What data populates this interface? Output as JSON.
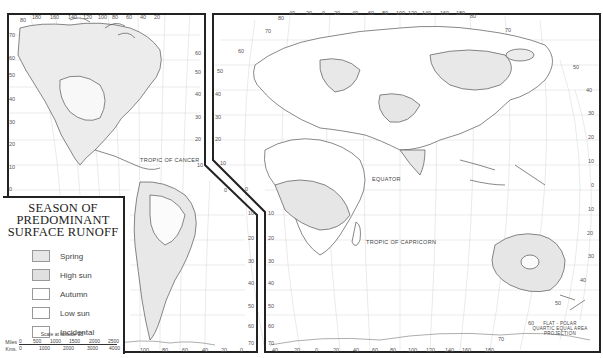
{
  "legend": {
    "title_lines": [
      "SEASON OF",
      "PREDOMINANT",
      "SURFACE RUNOFF"
    ],
    "items": [
      {
        "label": "Spring",
        "color": "#e6e6e6"
      },
      {
        "label": "High sun",
        "color": "#e0e0e0"
      },
      {
        "label": "Autumn",
        "color": "#ffffff"
      },
      {
        "label": "Low sun",
        "color": "#ffffff"
      },
      {
        "label": "Incidental",
        "color": "#ffffff"
      }
    ]
  },
  "scale": {
    "title": "Scale at latitude 35°",
    "miles_label": "Miles",
    "miles_ticks": [
      "0",
      "500",
      "1000",
      "1500",
      "2000",
      "2500"
    ],
    "kms_label": "Kms.",
    "kms_ticks": [
      "0",
      "1000",
      "2000",
      "3000",
      "4000"
    ]
  },
  "map_labels": {
    "tropic_of_cancer": "TROPIC OF CANCER",
    "equator": "EQUATOR",
    "tropic_of_capricorn": "TROPIC OF CAPRICORN",
    "projection_lines": [
      "FLAT - POLAR",
      "QUARTIC EQUAL AREA",
      "PROJECTION"
    ]
  },
  "americas_panel": {
    "top_longitudes": [
      "80",
      "180",
      "160",
      "140",
      "120",
      "100",
      "80",
      "60",
      "40",
      "20"
    ],
    "left_latitudes": [
      "70",
      "60",
      "50",
      "40",
      "30",
      "20",
      "10",
      "0"
    ],
    "right_latitudes": [
      "60",
      "50",
      "40",
      "30",
      "20",
      "10",
      "0",
      "10",
      "20",
      "30",
      "40",
      "50",
      "60",
      "70"
    ],
    "bottom_longitudes": [
      "100",
      "80",
      "60",
      "40",
      "20",
      "0"
    ]
  },
  "eastern_panel": {
    "top_longitudes": [
      "80",
      "40",
      "20",
      "0",
      "20",
      "40",
      "60",
      "80",
      "100",
      "120",
      "140",
      "160",
      "180"
    ],
    "left_latitudes": [
      "70",
      "60",
      "50",
      "40",
      "30",
      "20",
      "10",
      "0",
      "10",
      "20",
      "30",
      "40",
      "50",
      "60",
      "70"
    ],
    "right_latitudes": [
      "80",
      "70",
      "50",
      "40",
      "30",
      "20",
      "10",
      "0",
      "10",
      "20",
      "30",
      "40",
      "50",
      "60",
      "70"
    ],
    "bottom_longitudes": [
      "40",
      "20",
      "0",
      "20",
      "40",
      "60",
      "80",
      "100",
      "120",
      "140",
      "160",
      "180"
    ]
  },
  "colors": {
    "frame": "#222222",
    "coast": "#555555",
    "grid": "#cccccc",
    "shade": "#e4e4e4"
  }
}
